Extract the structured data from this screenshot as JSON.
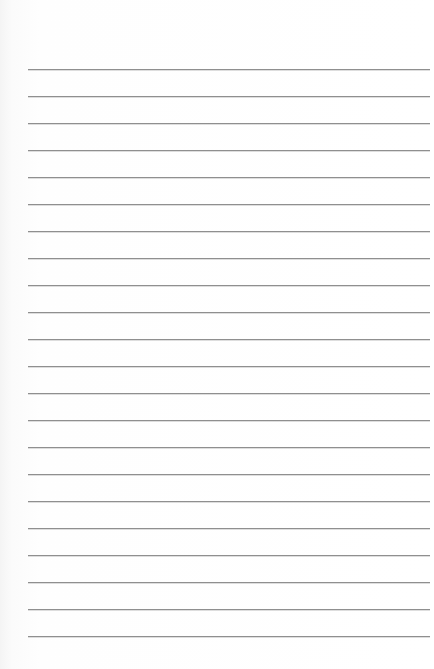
{
  "paper": {
    "type": "lined-paper",
    "line_count": 22,
    "first_line_y": 69,
    "line_spacing": 27,
    "line_left": 28,
    "line_right": 430,
    "line_color": "#8f8f8f",
    "background_color": "#ffffff"
  }
}
